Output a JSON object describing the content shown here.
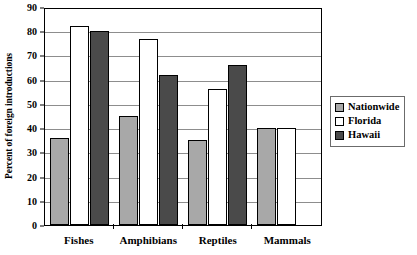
{
  "chart_data": {
    "type": "bar",
    "title": "",
    "subtitle": "",
    "xlabel": "",
    "ylabel": "Percent of foreign introductions",
    "ylim": [
      0,
      90
    ],
    "ytick_step": 10,
    "yticks": [
      0,
      10,
      20,
      30,
      40,
      50,
      60,
      70,
      80,
      90
    ],
    "grid": "horizontal",
    "legend_position": "right",
    "categories": [
      "Fishes",
      "Amphibians",
      "Reptiles",
      "Mammals"
    ],
    "series": [
      {
        "name": "Nationwide",
        "color": "#a8a8a8",
        "values": [
          36,
          45,
          35,
          40
        ]
      },
      {
        "name": "Florida",
        "color": "#ffffff",
        "values": [
          82,
          77,
          56,
          40
        ]
      },
      {
        "name": "Hawaii",
        "color": "#4a4a4a",
        "values": [
          80,
          62,
          66,
          null
        ]
      }
    ]
  }
}
